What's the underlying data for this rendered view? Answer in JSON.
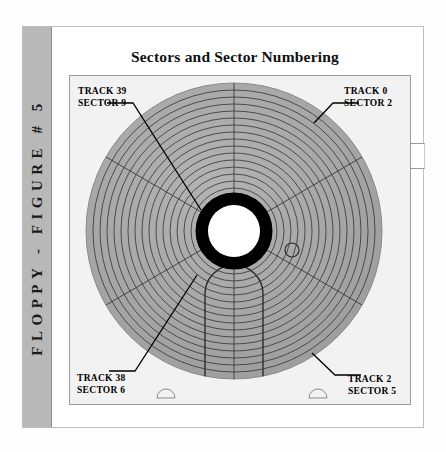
{
  "figure": {
    "side_label": "FLOPPY - FIGURE # 5",
    "title": "Sectors and Sector Numbering"
  },
  "annotations": [
    {
      "name": "track-39-sector-9",
      "line1": "TRACK 39",
      "line2": "SECTOR 9",
      "position": "top-left"
    },
    {
      "name": "track-0-sector-2",
      "line1": "TRACK 0",
      "line2": "SECTOR 2",
      "position": "top-right"
    },
    {
      "name": "track-38-sector-6",
      "line1": "TRACK 38",
      "line2": "SECTOR 6",
      "position": "bottom-left"
    },
    {
      "name": "track-2-sector-5",
      "line1": "TRACK 2",
      "line2": "SECTOR 5",
      "position": "bottom-right"
    }
  ],
  "diagram": {
    "type": "floppy-disk-sector-map",
    "track_count": 18,
    "sector_count": 6,
    "hub_label": "center-hub",
    "index_hole_label": "index-hole",
    "head_slot_label": "head-access-slot"
  },
  "colors": {
    "disk_surface": "#a8a8a8",
    "panel_background": "#f2f2f2",
    "side_bar": "#b8b8b8",
    "hub_ring": "#000000",
    "hub_center": "#ffffff",
    "line": "#303030",
    "text": "#000000"
  }
}
